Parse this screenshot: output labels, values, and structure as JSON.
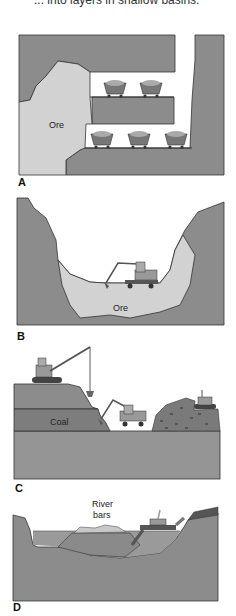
{
  "caption_fragment": "... into layers in shallow basins.",
  "panels": [
    {
      "id": "A",
      "label": "A",
      "title": "Underground mining",
      "ore_label": "Ore",
      "mine_cars_upper": 2,
      "mine_cars_lower": 3
    },
    {
      "id": "B",
      "label": "B",
      "title": "Open-pit mining",
      "ore_label": "Ore"
    },
    {
      "id": "C",
      "label": "C",
      "title": "Strip mining",
      "coal_label": "Coal"
    },
    {
      "id": "D",
      "label": "D",
      "title": "Dredging",
      "river_label_line1": "River",
      "river_label_line2": "bars"
    }
  ],
  "colors": {
    "rock": "#8c8c8c",
    "ore": "#d2d2d2",
    "coal_layer": "#7d7d7d",
    "background": "#ffffff",
    "outline": "#333333"
  }
}
